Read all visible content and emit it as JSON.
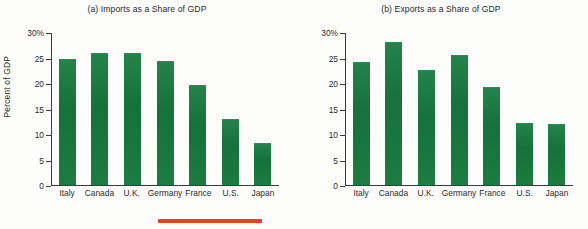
{
  "figure": {
    "ylabel": "Percent of GDP",
    "annotation_color": "#ef3b28",
    "bar_color": "#1a7a3c"
  },
  "chart_data": [
    {
      "type": "bar",
      "title": "(a) Imports as a Share of GDP",
      "categories": [
        "Italy",
        "Canada",
        "U.K.",
        "Germany",
        "France",
        "U.S.",
        "Japan"
      ],
      "values": [
        24.7,
        25.9,
        25.9,
        24.2,
        19.6,
        12.8,
        8.1
      ],
      "xlabel": "",
      "ylabel": "Percent of GDP",
      "ylim": [
        0,
        30
      ],
      "yticks": [
        0,
        5,
        10,
        15,
        20,
        25,
        30
      ],
      "ytick_labels": [
        "0",
        "5",
        "10",
        "15",
        "20",
        "25",
        "30%"
      ],
      "grid": false,
      "legend": false
    },
    {
      "type": "bar",
      "title": "(b) Exports as a Share of GDP",
      "categories": [
        "Italy",
        "Canada",
        "U.K.",
        "Germany",
        "France",
        "U.S.",
        "Japan"
      ],
      "values": [
        24.1,
        28.1,
        22.5,
        25.5,
        19.2,
        12.1,
        11.9
      ],
      "xlabel": "",
      "ylabel": "Percent of GDP",
      "ylim": [
        0,
        30
      ],
      "yticks": [
        0,
        5,
        10,
        15,
        20,
        25,
        30
      ],
      "ytick_labels": [
        "0",
        "5",
        "10",
        "15",
        "20",
        "25",
        "30%"
      ],
      "grid": false,
      "legend": false
    }
  ]
}
